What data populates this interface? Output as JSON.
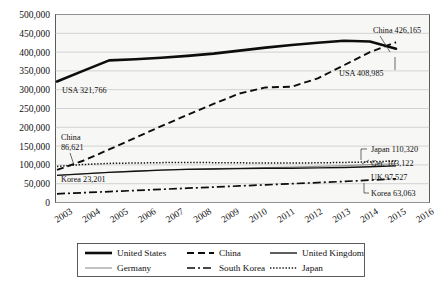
{
  "chart_data": {
    "type": "line",
    "title": "",
    "subtitle": "",
    "xlabel": "",
    "ylabel": "",
    "grid": true,
    "legend_position": "bottom",
    "ylim": [
      0,
      500000
    ],
    "ytick_labels": [
      "500,000",
      "450,000",
      "400,000",
      "350,000",
      "300,000",
      "250,000",
      "200,000",
      "150,000",
      "100,000",
      "50,000",
      "0"
    ],
    "ytick_values": [
      500000,
      450000,
      400000,
      350000,
      300000,
      250000,
      200000,
      150000,
      100000,
      50000,
      0
    ],
    "categories": [
      "2003",
      "2004",
      "2005",
      "2006",
      "2007",
      "2008",
      "2009",
      "2010",
      "2011",
      "2012",
      "2013",
      "2014",
      "2015",
      "2016"
    ],
    "series": [
      {
        "name": "United States",
        "style": "thick-solid",
        "values": [
          321766,
          350000,
          378000,
          381000,
          385000,
          390000,
          396000,
          404000,
          412000,
          419000,
          425000,
          430000,
          428000,
          408985
        ]
      },
      {
        "name": "China",
        "style": "dashed",
        "values": [
          86621,
          111000,
          141000,
          172000,
          203000,
          233000,
          262000,
          290000,
          306000,
          308000,
          330000,
          365000,
          400000,
          426165
        ]
      },
      {
        "name": "United Kingdom",
        "style": "thin-solid",
        "values": [
          72000,
          76000,
          80000,
          83000,
          86000,
          88000,
          89000,
          90000,
          91000,
          91000,
          92000,
          93000,
          95000,
          97527
        ]
      },
      {
        "name": "Germany",
        "style": "thin-gray",
        "values": [
          72500,
          76500,
          80500,
          83500,
          86500,
          88500,
          90000,
          91500,
          93000,
          94000,
          96000,
          98000,
          100500,
          103122
        ]
      },
      {
        "name": "South Korea",
        "style": "dash-dot",
        "values": [
          23201,
          26000,
          29000,
          32000,
          35000,
          38000,
          41000,
          44000,
          47000,
          50000,
          53000,
          56000,
          59500,
          63063
        ]
      },
      {
        "name": "Japan",
        "style": "dotted",
        "values": [
          96000,
          101000,
          104000,
          105000,
          106000,
          106500,
          106000,
          105500,
          105000,
          105000,
          105500,
          106500,
          108000,
          110320
        ]
      }
    ],
    "annotations": [
      {
        "id": "usa-start",
        "text": "USA 321,766"
      },
      {
        "id": "china-start-line1",
        "text": "China"
      },
      {
        "id": "china-start-line2",
        "text": "86,621"
      },
      {
        "id": "korea-start",
        "text": "Korea 23,201"
      },
      {
        "id": "china-end",
        "text": "China 426,165"
      },
      {
        "id": "usa-end",
        "text": "USA 408,985"
      },
      {
        "id": "japan-end",
        "text": "Japan 110,320"
      },
      {
        "id": "germany-end",
        "text": "Ger. 103,122"
      },
      {
        "id": "uk-end",
        "text": "UK 97,527"
      },
      {
        "id": "korea-end",
        "text": "Korea 63,063"
      }
    ]
  },
  "legend": {
    "entries": [
      {
        "label": "United States"
      },
      {
        "label": "China"
      },
      {
        "label": "United Kingdom"
      },
      {
        "label": "Germany"
      },
      {
        "label": "South Korea"
      },
      {
        "label": "Japan"
      }
    ]
  },
  "colors": {
    "plot_background": "#f7f7f5",
    "gridline": "#b9b9b9",
    "border": "#4a4a4a",
    "primary_line": "#0d0d0d",
    "gray_line": "#9a9a9a"
  }
}
